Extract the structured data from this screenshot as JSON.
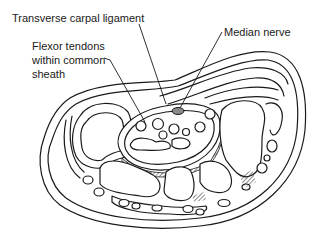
{
  "figure": {
    "type": "anatomical cross-section",
    "labels": [
      {
        "id": "ligament",
        "text": "Transverse carpal ligament"
      },
      {
        "id": "nerve",
        "text": "Median nerve"
      },
      {
        "id": "tendons",
        "lines": [
          "Flexor tendons",
          "within common",
          "sheath"
        ]
      }
    ],
    "colors": {
      "line": "#1a1a1a",
      "background": "#ffffff",
      "nerve_fill": "#8a8a8a"
    }
  }
}
